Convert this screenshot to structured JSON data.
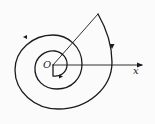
{
  "diagram": {
    "type": "spiral",
    "labels": {
      "origin": "O",
      "x_axis": "x"
    },
    "colors": {
      "stroke": "#1a1a1a",
      "background": "#fbfbfb"
    },
    "elements": [
      {
        "kind": "polar-axis",
        "label": "x",
        "from": [
          53,
          65
        ],
        "to": [
          143,
          65
        ]
      },
      {
        "kind": "ray",
        "from": [
          53,
          65
        ],
        "to": [
          98,
          14
        ]
      },
      {
        "kind": "spiral-curve",
        "center": [
          53,
          65
        ],
        "turns": 2.2,
        "direction": "counterclockwise-outward"
      }
    ]
  }
}
